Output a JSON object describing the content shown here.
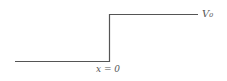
{
  "diagram": {
    "labels": {
      "potential": "V₀",
      "boundary": "x = 0"
    },
    "colors": {
      "line": "#555555",
      "text": "#555555",
      "background": "#ffffff"
    },
    "geometry": {
      "low_segment": {
        "x1": 15,
        "x2": 109,
        "y": 61
      },
      "step": {
        "x": 109,
        "y1": 14,
        "y2": 61
      },
      "high_segment": {
        "x1": 109,
        "x2": 198,
        "y": 14
      }
    }
  }
}
